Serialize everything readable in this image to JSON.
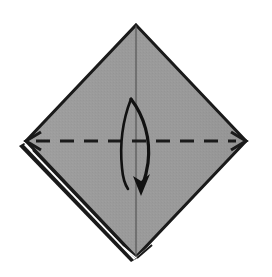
{
  "figure": {
    "type": "origami-instruction",
    "canvas": {
      "width": 272,
      "height": 277,
      "background": "#ffffff"
    }
  },
  "colors": {
    "paper_fill": "#9a9a9a",
    "paper_fill_shade": "#939393",
    "outline": "#1a1a1a",
    "crease_line": "#1a1a1a",
    "arrow": "#111111",
    "layer_gap": "#ffffff",
    "background": "#ffffff"
  },
  "shapes": {
    "paper": {
      "name": "square-base-diamond",
      "label": "Folded paper square rotated 45 degrees",
      "vertices": {
        "top": {
          "x": 136,
          "y": 25
        },
        "left": {
          "x": 26,
          "y": 141
        },
        "right": {
          "x": 246,
          "y": 141
        },
        "bottom": {
          "x": 136,
          "y": 257
        }
      },
      "points": "136,25 246,141 136,257 26,141",
      "fill": "#9a9a9a",
      "stroke": "#1a1a1a",
      "stroke_width": 3
    },
    "center_line": {
      "name": "vertical-center-line",
      "label": "Vertical center line from top vertex to bottom vertex",
      "x1": 136,
      "y1": 25,
      "x2": 136,
      "y2": 257,
      "stroke": "#4a4a4a",
      "stroke_width": 1
    },
    "layer_edges": [
      {
        "name": "lower-left-layer-edge",
        "label": "Offset layer edge along lower-left side",
        "x1": 28,
        "y1": 146,
        "x2": 134,
        "y2": 258,
        "offset_x": -3,
        "offset_y": 3
      },
      {
        "name": "bottom-left-inner-layer-edge",
        "label": "Inner layer edge converging at bottom vertex",
        "x1": 33,
        "y1": 149,
        "x2": 135,
        "y2": 256,
        "offset_x": -2,
        "offset_y": 2
      }
    ]
  },
  "crease": {
    "name": "valley-fold-crease",
    "label": "Horizontal dashed valley fold line",
    "line_type": "dashed",
    "y": 141,
    "x_start": 26,
    "x_end": 246,
    "dash_pattern": "14 10",
    "stroke": "#1a1a1a",
    "stroke_width": 3,
    "end_arrows": [
      "left",
      "right"
    ]
  },
  "fold_arrow": {
    "name": "fold-direction-arrow",
    "label": "Curved arrow indicating downward valley fold",
    "direction": "down",
    "head_style": "solid-filled",
    "path": "M 131,99 C 144,116 151,139 148,163 C 146,178 142,186 141,190",
    "tail_path": "M 131,99 C 122,122 120,148 122,168 C 123,180 126,186 128,189",
    "head": {
      "tip_x": 141,
      "tip_y": 194,
      "width": 13,
      "length": 17
    },
    "stroke": "#111111",
    "stroke_width": 3
  },
  "annotations": {
    "step_number": "",
    "caption": ""
  }
}
